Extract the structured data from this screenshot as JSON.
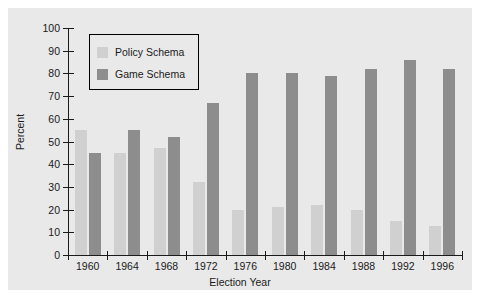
{
  "chart_data": {
    "type": "bar",
    "title": "",
    "xlabel": "Election Year",
    "ylabel": "Percent",
    "categories": [
      "1960",
      "1964",
      "1968",
      "1972",
      "1976",
      "1980",
      "1984",
      "1988",
      "1992",
      "1996"
    ],
    "series": [
      {
        "name": "Policy Schema",
        "color": "#d0d0d0",
        "values": [
          55,
          45,
          47,
          32,
          20,
          21,
          22,
          20,
          15,
          13
        ]
      },
      {
        "name": "Game Schema",
        "color": "#8d8d8d",
        "values": [
          45,
          55,
          52,
          67,
          80,
          80,
          79,
          82,
          86,
          82
        ]
      }
    ],
    "ylim": [
      0,
      100
    ],
    "yticks": [
      0,
      10,
      20,
      30,
      40,
      50,
      60,
      70,
      80,
      90,
      100
    ],
    "ytick_labels": [
      "0",
      "10",
      "20",
      "30",
      "40",
      "50",
      "60",
      "70",
      "80",
      "90",
      "100"
    ],
    "grid": false,
    "legend_position": "top-left",
    "background": "#e9e9e9",
    "axis_color": "#1a1a1a"
  }
}
